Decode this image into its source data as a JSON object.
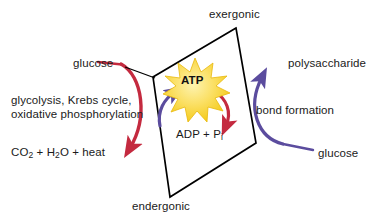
{
  "diagram": {
    "labels": {
      "exergonic": "exergonic",
      "endergonic": "endergonic",
      "glucose_left": "glucose",
      "pathway": "glycolysis, Krebs cycle,\noxidative phosphorylation",
      "co2_products": "CO₂ + H₂O + heat",
      "atp": "ATP",
      "adp": "ADP + P",
      "adp_subscript": "i",
      "polysaccharide": "polysaccharide",
      "bond_formation": "bond formation",
      "glucose_right": "glucose"
    },
    "colors": {
      "exergonic_arrow": "#c42a3f",
      "endergonic_arrow": "#5b4c9e",
      "atp_burst_fill": "#f7d417",
      "atp_burst_mid": "#fbe87a",
      "frame_line": "#000000",
      "text": "#1a1a1a",
      "background": "#ffffff"
    },
    "shapes": {
      "parallelogram_vertices": "top-right (236,28), left (153,77), bottom (170,197), right (256,143)",
      "frame_note": "black parallelogram linking exergonic (top) to endergonic (bottom)"
    },
    "arrows": [
      {
        "name": "glycolysis-arc",
        "color": "#c42a3f",
        "from": "glucose",
        "to": "CO2 + H2O + heat",
        "type": "exergonic"
      },
      {
        "name": "atp-synthesis-arrow",
        "color": "#5b4c9e",
        "from": "ADP + Pi",
        "to": "ATP",
        "type": "endergonic"
      },
      {
        "name": "atp-hydrolysis-arrow",
        "color": "#c42a3f",
        "from": "ATP",
        "to": "ADP + Pi",
        "type": "exergonic"
      },
      {
        "name": "bond-formation-arc",
        "color": "#5b4c9e",
        "from": "glucose",
        "to": "polysaccharide",
        "type": "endergonic"
      }
    ]
  }
}
